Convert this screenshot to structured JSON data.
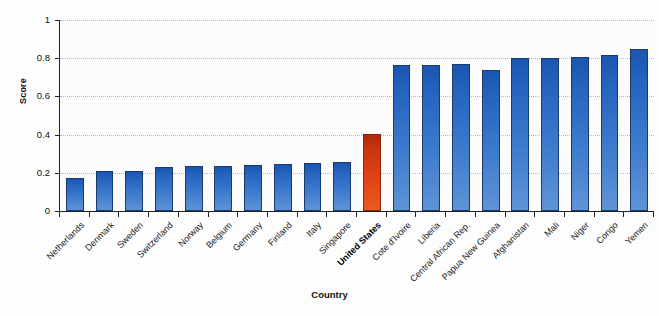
{
  "chart_data": {
    "type": "bar",
    "title": "",
    "xlabel": "Country",
    "ylabel": "Score",
    "ylim": [
      0,
      1
    ],
    "yticks": [
      "0",
      "0.2",
      "0.4",
      "0.6",
      "0.8",
      "1"
    ],
    "grid": true,
    "legend": "none",
    "categories": [
      "Netherlands",
      "Denmark",
      "Sweden",
      "Switzerland",
      "Norway",
      "Belgium",
      "Germany",
      "Finland",
      "Italy",
      "Singapore",
      "United States",
      "Cote d'Ivoire",
      "Liberia",
      "Central African Rep.",
      "Papua New Guinea",
      "Afghanistan",
      "Mali",
      "Niger",
      "Congo",
      "Yemen"
    ],
    "values": [
      0.175,
      0.21,
      0.21,
      0.23,
      0.235,
      0.235,
      0.24,
      0.245,
      0.25,
      0.255,
      0.405,
      0.765,
      0.765,
      0.772,
      0.74,
      0.8,
      0.8,
      0.805,
      0.815,
      0.85
    ],
    "highlight_category": "United States",
    "colors": {
      "bar_top": "#1b55b0",
      "bar_bottom": "#5f93d6",
      "bar_outline": "#1b3a6b",
      "highlight_top": "#b2290c",
      "highlight_bottom": "#e85a22",
      "highlight_outline": "#8c2408",
      "axis": "#222222",
      "gridline": "#b9b9b9",
      "plot_background": "#fcfcfc"
    }
  }
}
